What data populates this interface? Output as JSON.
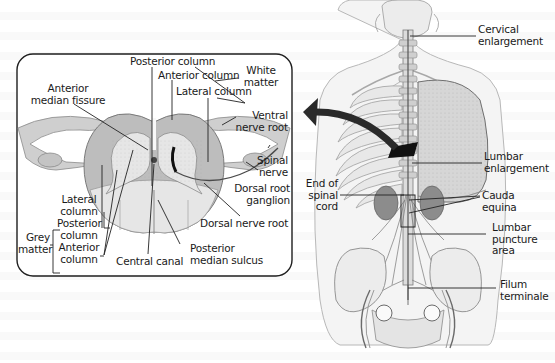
{
  "figure": {
    "type": "anatomical-diagram",
    "subject": "Spinal cord",
    "colors": {
      "box_border": "#1e1e1e",
      "nerve_tissue": "#cfcfcf",
      "white_matter": "#bcbcbc",
      "grey_matter": "#e2e2e2",
      "body_outline": "#8a8a8a",
      "arrow": "#2a2a2a",
      "label_text": "#1a1a1a"
    }
  },
  "cross_section": {
    "labels": {
      "posterior_column_top": "Posterior column",
      "anterior_column_top": "Anterior column",
      "lateral_column_top": "Lateral column",
      "white_matter_l1": "White",
      "white_matter_l2": "matter",
      "anterior_median_fissure_l1": "Anterior",
      "anterior_median_fissure_l2": "median fissure",
      "ventral_nerve_root_l1": "Ventral",
      "ventral_nerve_root_l2": "nerve root",
      "spinal_nerve_l1": "Spinal",
      "spinal_nerve_l2": "nerve",
      "dorsal_root_ganglion_l1": "Dorsal root",
      "dorsal_root_ganglion_l2": "ganglion",
      "dorsal_nerve_root": "Dorsal nerve root",
      "grey_matter_l1": "Grey",
      "grey_matter_l2": "matter",
      "lateral_column_l1": "Lateral",
      "lateral_column_l2": "column",
      "posterior_column_l1": "Posterior",
      "posterior_column_l2": "column",
      "anterior_column_l1": "Anterior",
      "anterior_column_l2": "column",
      "central_canal": "Central canal",
      "posterior_median_sulcus_l1": "Posterior",
      "posterior_median_sulcus_l2": "median sulcus"
    }
  },
  "body_view": {
    "labels": {
      "cervical_enlargement_l1": "Cervical",
      "cervical_enlargement_l2": "enlargement",
      "lumbar_enlargement_l1": "Lumbar",
      "lumbar_enlargement_l2": "enlargement",
      "end_of_spinal_cord_l1": "End of",
      "end_of_spinal_cord_l2": "spinal",
      "end_of_spinal_cord_l3": "cord",
      "cauda_equina_l1": "Cauda",
      "cauda_equina_l2": "equina",
      "lumbar_puncture_area_l1": "Lumbar",
      "lumbar_puncture_area_l2": "puncture",
      "lumbar_puncture_area_l3": "area",
      "filum_terminale_l1": "Filum",
      "filum_terminale_l2": "terminale"
    }
  }
}
